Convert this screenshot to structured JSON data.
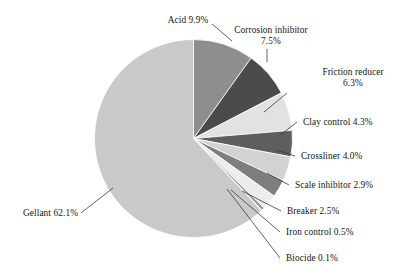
{
  "chart_data": {
    "type": "pie",
    "title": "",
    "subtitle": "",
    "xlabel": "",
    "ylabel": "",
    "legend_position": "callout-labels",
    "grid": false,
    "units": "percent",
    "total": 100.0,
    "start_angle_deg": -90,
    "direction": "clockwise",
    "categories": [
      "Acid",
      "Corrosion inhibitor",
      "Friction reducer",
      "Clay control",
      "Crossliner",
      "Scale inhibitor",
      "Breaker",
      "Iron control",
      "Biocide",
      "Gellant"
    ],
    "values": [
      9.9,
      7.5,
      6.3,
      4.3,
      4.0,
      2.9,
      2.5,
      0.5,
      0.1,
      62.1
    ],
    "colors": [
      "#8e8e8e",
      "#4b4b4b",
      "#e2e2e2",
      "#5e5e5e",
      "#d2d2d2",
      "#7e7e7e",
      "#ececec",
      "#9a9a9a",
      "#bdbdbd",
      "#c9c9c9"
    ],
    "slices": [
      {
        "label": "Acid",
        "value": 9.9,
        "value_label": "9.9%",
        "text": "Acid 9.9%",
        "color": "#8e8e8e"
      },
      {
        "label": "Corrosion inhibitor",
        "value": 7.5,
        "value_label": "7.5%",
        "text": "Corrosion inhibitor 7.5%",
        "color": "#4b4b4b"
      },
      {
        "label": "Friction reducer",
        "value": 6.3,
        "value_label": "6.3%",
        "text": "Friction reducer 6.3%",
        "color": "#e2e2e2"
      },
      {
        "label": "Clay control",
        "value": 4.3,
        "value_label": "4.3%",
        "text": "Clay control 4.3%",
        "color": "#5e5e5e"
      },
      {
        "label": "Crossliner",
        "value": 4.0,
        "value_label": "4.0%",
        "text": "Crossliner 4.0%",
        "color": "#d2d2d2"
      },
      {
        "label": "Scale inhibitor",
        "value": 2.9,
        "value_label": "2.9%",
        "text": "Scale inhibitor 2.9%",
        "color": "#7e7e7e"
      },
      {
        "label": "Breaker",
        "value": 2.5,
        "value_label": "2.5%",
        "text": "Breaker 2.5%",
        "color": "#ececec"
      },
      {
        "label": "Iron control",
        "value": 0.5,
        "value_label": "0.5%",
        "text": "Iron control 0.5%",
        "color": "#9a9a9a"
      },
      {
        "label": "Biocide",
        "value": 0.1,
        "value_label": "0.1%",
        "text": "Biocide 0.1%",
        "color": "#bdbdbd"
      },
      {
        "label": "Gellant",
        "value": 62.1,
        "value_label": "62.1%",
        "text": "Gellant 62.1%",
        "color": "#c9c9c9"
      }
    ]
  },
  "labels": {
    "acid": "Acid 9.9%",
    "corrosion_inhibitor_line1": "Corrosion inhibitor",
    "corrosion_inhibitor_line2": "7.5%",
    "friction_reducer_line1": "Friction reducer",
    "friction_reducer_line2": "6.3%",
    "clay_control": "Clay control 4.3%",
    "crossliner": "Crossliner 4.0%",
    "scale_inhibitor": "Scale inhibitor 2.9%",
    "breaker": "Breaker 2.5%",
    "iron_control": "Iron control 0.5%",
    "biocide": "Biocide 0.1%",
    "gellant": "Gellant 62.1%"
  }
}
